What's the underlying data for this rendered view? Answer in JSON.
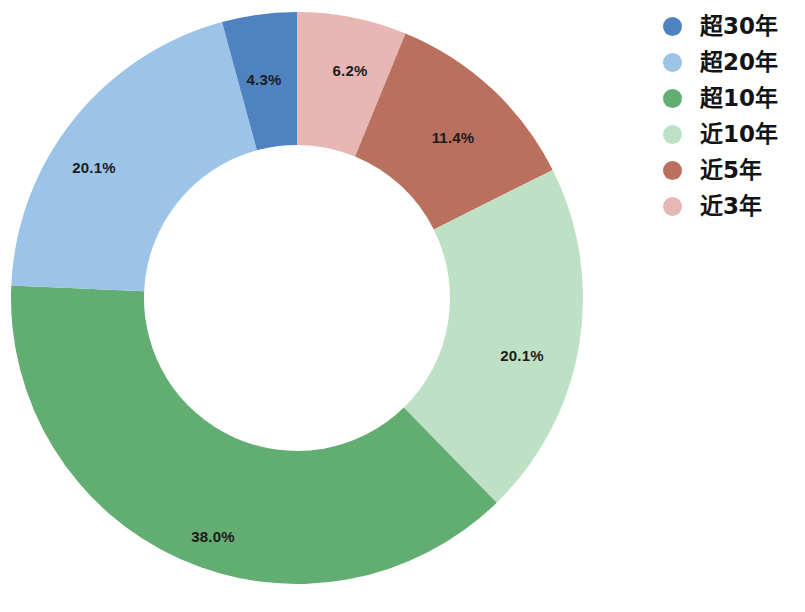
{
  "chart_data": {
    "type": "pie",
    "variant": "donut",
    "title": "",
    "subtitle": "",
    "xlabel": "",
    "ylabel": "",
    "grid": false,
    "legend_position": "right",
    "units": "%",
    "start_angle_deg": 0,
    "direction": "clockwise",
    "geometry": {
      "center_x": 297,
      "center_y": 298,
      "outer_radius": 286,
      "inner_radius": 153
    },
    "categories": [
      "超30年",
      "超20年",
      "超10年",
      "近10年",
      "近5年",
      "近3年"
    ],
    "values": [
      4.3,
      20.1,
      38.0,
      20.1,
      11.4,
      6.2
    ],
    "value_labels": [
      "4.3%",
      "20.1%",
      "38.0%",
      "20.1%",
      "11.4%",
      "6.2%"
    ],
    "colors": [
      "#4f82c0",
      "#9cc3e8",
      "#62ad72",
      "#bee0c4",
      "#b9705f",
      "#e8b7b4"
    ],
    "slices": [
      {
        "name": "近3年",
        "value": 6.2,
        "label": "6.2%",
        "color": "#e8b7b4",
        "start_deg": 0.0,
        "end_deg": 22.3,
        "label_x": 350,
        "label_y": 70
      },
      {
        "name": "近5年",
        "value": 11.4,
        "label": "11.4%",
        "color": "#b9705f",
        "start_deg": 22.3,
        "end_deg": 63.4,
        "label_x": 453,
        "label_y": 137
      },
      {
        "name": "近10年",
        "value": 20.1,
        "label": "20.1%",
        "color": "#bee0c4",
        "start_deg": 63.4,
        "end_deg": 135.7,
        "label_x": 522,
        "label_y": 355
      },
      {
        "name": "超10年",
        "value": 38.0,
        "label": "38.0%",
        "color": "#62ad72",
        "start_deg": 135.7,
        "end_deg": 272.5,
        "label_x": 213,
        "label_y": 536
      },
      {
        "name": "超20年",
        "value": 20.1,
        "label": "20.1%",
        "color": "#9cc3e8",
        "start_deg": 272.5,
        "end_deg": 344.8,
        "label_x": 94,
        "label_y": 167
      },
      {
        "name": "超30年",
        "value": 4.3,
        "label": "4.3%",
        "color": "#4f82c0",
        "start_deg": 344.8,
        "end_deg": 360.0,
        "label_x": 264,
        "label_y": 79
      }
    ]
  },
  "legend": {
    "items": [
      {
        "label": "超30年",
        "color": "#4f82c0"
      },
      {
        "label": "超20年",
        "color": "#9cc3e8"
      },
      {
        "label": "超10年",
        "color": "#62ad72"
      },
      {
        "label": "近10年",
        "color": "#bee0c4"
      },
      {
        "label": "近5年",
        "color": "#b9705f"
      },
      {
        "label": "近3年",
        "color": "#e8b7b4"
      }
    ]
  }
}
